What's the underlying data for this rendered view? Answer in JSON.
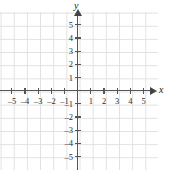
{
  "chart_data": {
    "type": "scatter",
    "title": "",
    "subtitle": "",
    "xlabel": "x",
    "ylabel": "y",
    "xlim": [
      -5.9,
      5.6
    ],
    "ylim": [
      -5.9,
      5.9
    ],
    "x_ticks": [
      -5,
      -4,
      -3,
      -2,
      -1,
      1,
      2,
      3,
      4,
      5
    ],
    "y_ticks": [
      5,
      4,
      3,
      2,
      1,
      -1,
      -2,
      -3,
      -4,
      -5
    ],
    "x_tick_labels": [
      "–5",
      "–4",
      "–3",
      "–2",
      "–1",
      "1",
      "2",
      "3",
      "4",
      "5"
    ],
    "y_tick_labels": [
      "5",
      "4",
      "3",
      "2",
      "1",
      "–1",
      "–2",
      "–3",
      "–4",
      "–5"
    ],
    "origin_label": "",
    "grid": true,
    "grid_step": 1,
    "legend": null,
    "series": [],
    "annotations": [],
    "colors": {
      "grid": "#dcdcdc",
      "axis": "#555555",
      "arrow": "#444444",
      "label": "#2b2b2b",
      "background": "#ffffff"
    }
  },
  "axes": {
    "x_name": "x",
    "y_name": "y"
  },
  "icons": {
    "x_arrow": "arrow-right-icon",
    "y_arrow": "arrow-up-icon"
  }
}
